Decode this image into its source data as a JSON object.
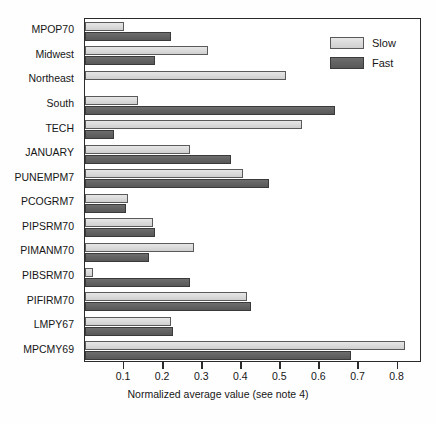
{
  "chart_data": {
    "type": "bar",
    "orientation": "horizontal",
    "title": "",
    "xlabel": "Normalized average value (see note 4)",
    "ylabel": "",
    "xlim": [
      0,
      0.855
    ],
    "xticks": [
      0.1,
      0.2,
      0.3,
      0.4,
      0.5,
      0.6,
      0.7,
      0.8
    ],
    "xtick_labels": [
      "0.1",
      "0.2",
      "0.3",
      "0.4",
      "0.5",
      "0.6",
      "0.7",
      "0.8"
    ],
    "grid": false,
    "legend_position": "top-right",
    "categories": [
      "MPOP70",
      "Midwest",
      "Northeast",
      "South",
      "TECH",
      "JANUARY",
      "PUNEMPM7",
      "PCOGRM7",
      "PIPSRM70",
      "PIMANM70",
      "PIBSRM70",
      "PIFIRM70",
      "LMPY67",
      "MPCMY69"
    ],
    "series": [
      {
        "name": "Slow",
        "color": "#dcdcdc",
        "values": [
          0.1,
          0.315,
          0.515,
          0.135,
          0.555,
          0.27,
          0.405,
          0.11,
          0.175,
          0.28,
          0.02,
          0.415,
          0.22,
          0.82
        ]
      },
      {
        "name": "Fast",
        "color": "#636363",
        "values": [
          0.22,
          0.18,
          0.0,
          0.64,
          0.075,
          0.375,
          0.47,
          0.105,
          0.18,
          0.165,
          0.27,
          0.425,
          0.225,
          0.68
        ]
      }
    ]
  },
  "legend": {
    "items": [
      {
        "label": "Slow",
        "swatch": "slow"
      },
      {
        "label": "Fast",
        "swatch": "fast"
      }
    ]
  },
  "axis": {
    "x_title": "Normalized average value (see note 4)"
  }
}
